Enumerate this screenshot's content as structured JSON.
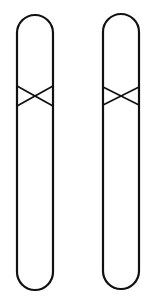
{
  "diagram": {
    "title": "",
    "stroke_color": "#111111",
    "background": "#ffffff",
    "shapes": [
      {
        "id": "left-chromatid",
        "x": 17,
        "y": 15,
        "width": 36,
        "height": 275,
        "cross": {
          "y_top": 86,
          "y_bottom": 106
        }
      },
      {
        "id": "right-chromatid",
        "x": 103,
        "y": 14,
        "width": 36,
        "height": 275,
        "cross": {
          "y_top": 87,
          "y_bottom": 105
        }
      }
    ]
  }
}
